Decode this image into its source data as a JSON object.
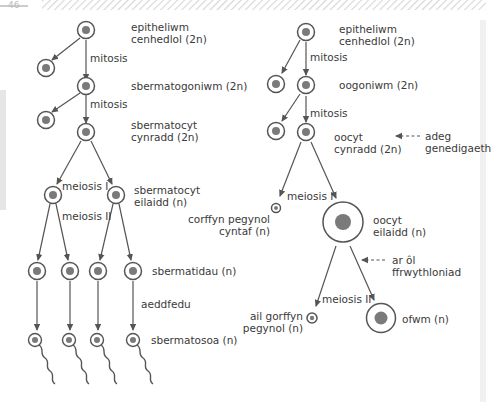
{
  "header": {
    "page_number": "46",
    "hatch_color": "#d8d8d8"
  },
  "colors": {
    "line": "#555555",
    "cell_ring": "#555555",
    "nucleus": "#7a7a7a",
    "text": "#3a3a3a",
    "gutter_left": "#e8e8e8",
    "gutter_right": "#f0f0f0"
  },
  "spermatogenesis": {
    "stage1": {
      "line1": "epitheliwm",
      "line2": "cenhedlol (2n)"
    },
    "mitosis1": "mitosis",
    "stage2": "sbermatogoniwm (2n)",
    "mitosis2": "mitosis",
    "stage3": {
      "line1": "sbermatocyt",
      "line2": "cynradd (2n)"
    },
    "meiosis1": "meiosis I",
    "stage4": {
      "line1": "sbermatocyt",
      "line2": "eilaidd (n)"
    },
    "meiosis2": "meiosis II",
    "stage5": "sbermatidau (n)",
    "maturation": "aeddfedu",
    "stage6": "sbermatosoa (n)"
  },
  "oogenesis": {
    "stage1": {
      "line1": "epitheliwm",
      "line2": "cenhedlol (2n)"
    },
    "mitosis1": "mitosis",
    "stage2": "oogoniwm (2n)",
    "mitosis2": "mitosis",
    "stage3": {
      "line1": "oocyt",
      "line2": "cynradd (2n)"
    },
    "note_birth": {
      "line1": "adeg",
      "line2": "genedigaeth"
    },
    "meiosis1": "meiosis I",
    "polar1": {
      "line1": "corffyn pegynol",
      "line2": "cyntaf (n)"
    },
    "stage4": {
      "line1": "oocyt",
      "line2": "eilaidd (n)"
    },
    "note_fert": {
      "line1": "ar ôl",
      "line2": "ffrwythloniad"
    },
    "meiosis2": "meiosis II",
    "polar2": {
      "line1": "ail gorffyn",
      "line2": "pegynol (n)"
    },
    "stage5": "ofwm (n)"
  }
}
